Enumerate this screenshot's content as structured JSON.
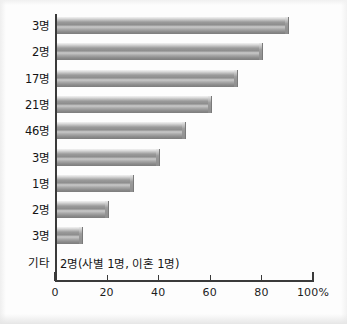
{
  "chart_data": {
    "type": "bar",
    "orientation": "horizontal",
    "title": "",
    "subtitle": "",
    "xlabel": "",
    "ylabel": "",
    "xlim": [
      0,
      100
    ],
    "xticks": [
      "0",
      "20",
      "40",
      "60",
      "80",
      "100%"
    ],
    "xtick_values": [
      0,
      20,
      40,
      60,
      80,
      100
    ],
    "grid": false,
    "legend": "none",
    "categories": [
      "3명",
      "2명",
      "17명",
      "21명",
      "46명",
      "3명",
      "1명",
      "2명",
      "3명",
      "기타"
    ],
    "values": [
      90,
      80,
      70,
      60,
      50,
      40,
      30,
      20,
      10,
      0
    ],
    "annotations": [
      {
        "row": "기타",
        "text": "2명(사별 1명, 이혼 1명)"
      }
    ],
    "bar_color": "#989898",
    "axis_color": "#3a3a3a",
    "text_color": "#141414"
  },
  "chart": {
    "rows": [
      {
        "label": "3명",
        "value": 90,
        "bar": true
      },
      {
        "label": "2명",
        "value": 80,
        "bar": true
      },
      {
        "label": "17명",
        "value": 70,
        "bar": true
      },
      {
        "label": "21명",
        "value": 60,
        "bar": true
      },
      {
        "label": "46명",
        "value": 50,
        "bar": true
      },
      {
        "label": "3명",
        "value": 40,
        "bar": true
      },
      {
        "label": "1명",
        "value": 30,
        "bar": true
      },
      {
        "label": "2명",
        "value": 20,
        "bar": true
      },
      {
        "label": "3명",
        "value": 10,
        "bar": true
      },
      {
        "label": "기타",
        "value": 0,
        "bar": false,
        "note": "2명(사별 1명, 이혼 1명)"
      }
    ],
    "axis": {
      "ticks": [
        {
          "label": "0",
          "value": 0
        },
        {
          "label": "20",
          "value": 20
        },
        {
          "label": "40",
          "value": 40
        },
        {
          "label": "60",
          "value": 60
        },
        {
          "label": "80",
          "value": 80
        },
        {
          "label": "100%",
          "value": 100
        }
      ]
    }
  }
}
